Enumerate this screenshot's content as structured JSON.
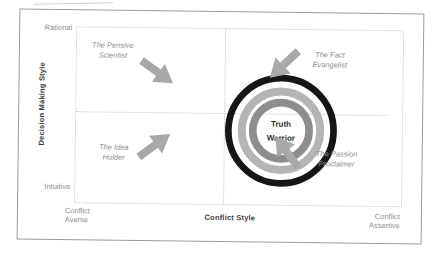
{
  "diagram": {
    "y_axis": {
      "title": "Decision Making Style",
      "top_label": "Rational",
      "bottom_label": "Intuitive"
    },
    "x_axis": {
      "title": "Conflict Style",
      "left_label": {
        "line1": "Conflict",
        "line2": "Averse"
      },
      "right_label": {
        "line1": "Conflict",
        "line2": "Assertive"
      }
    },
    "center": {
      "line1": "Truth",
      "line2": "Warrior"
    },
    "quadrants": [
      {
        "position": "top-left",
        "line1": "The Pensive",
        "line2": "Scientist"
      },
      {
        "position": "top-right",
        "line1": "The Fact",
        "line2": "Evangelist"
      },
      {
        "position": "bottom-left",
        "line1": "The Idea",
        "line2": "Holder"
      },
      {
        "position": "bottom-right",
        "line1": "The Passion",
        "line2": "Proclaimer"
      }
    ],
    "colors": {
      "frame_border": "#9c9c9c",
      "plot_border": "#e2e2e2",
      "dotted": "#c8c8c8",
      "tick_gray": "#8e8e8e",
      "label_gray": "#8e8e8e",
      "axis_text": "#3d3d3d",
      "arrow": "#a8a8a8",
      "ring_outer": "#161616",
      "ring_mid": "#b4b4b4",
      "ring_inner": "#8d8d8d",
      "center_text": "#2b2b2b"
    }
  }
}
